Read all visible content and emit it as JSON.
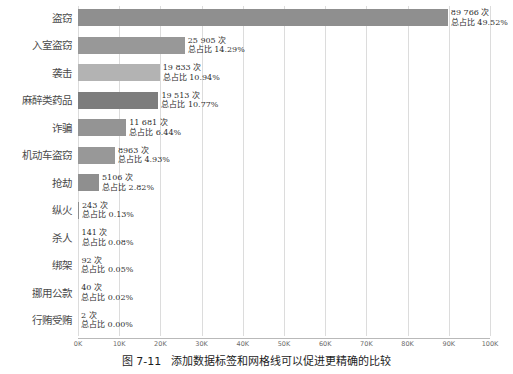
{
  "caption": {
    "number": "图 7-11",
    "text": "添加数据标签和网格线可以促进更精确的比较"
  },
  "chart_data": {
    "type": "bar",
    "orientation": "horizontal",
    "title": "",
    "xlabel": "",
    "ylabel": "",
    "xlim": [
      0,
      100000
    ],
    "grid": true,
    "legend": "none",
    "xticks": [
      "0K",
      "10K",
      "20K",
      "30K",
      "40K",
      "50K",
      "60K",
      "70K",
      "80K",
      "90K",
      "100K"
    ],
    "xtick_values": [
      0,
      10000,
      20000,
      30000,
      40000,
      50000,
      60000,
      70000,
      80000,
      90000,
      100000
    ],
    "categories": [
      "盗窃",
      "入室盗窃",
      "袭击",
      "麻醉类药品",
      "诈骗",
      "机动车盗窃",
      "抢劫",
      "纵火",
      "杀人",
      "绑架",
      "挪用公款",
      "行贿受贿"
    ],
    "values": [
      89766,
      25905,
      19833,
      19513,
      11681,
      8963,
      5106,
      243,
      141,
      92,
      40,
      2
    ],
    "percents": [
      49.52,
      14.29,
      10.94,
      10.77,
      6.44,
      4.93,
      2.82,
      0.13,
      0.08,
      0.05,
      0.02,
      0.0
    ],
    "data_labels": [
      {
        "count": "89 766 次",
        "percent": "总占比 49.52%"
      },
      {
        "count": "25 905 次",
        "percent": "总占比 14.29%"
      },
      {
        "count": "19 833 次",
        "percent": "总占比 10.94%"
      },
      {
        "count": "19 513 次",
        "percent": "总占比 10.77%"
      },
      {
        "count": "11 681 次",
        "percent": "总占比 6.44%"
      },
      {
        "count": "8963 次",
        "percent": "总占比 4.93%"
      },
      {
        "count": "5106 次",
        "percent": "总占比 2.82%"
      },
      {
        "count": "243 次",
        "percent": "总占比 0.13%"
      },
      {
        "count": "141 次",
        "percent": "总占比 0.08%"
      },
      {
        "count": "92 次",
        "percent": "总占比 0.05%"
      },
      {
        "count": "40 次",
        "percent": "总占比 0.02%"
      },
      {
        "count": "2 次",
        "percent": "总占比 0.00%"
      }
    ],
    "bar_color": "#9a9a9a",
    "grid_color": "#dcdcdc",
    "axis_color": "#b9b9b9"
  }
}
